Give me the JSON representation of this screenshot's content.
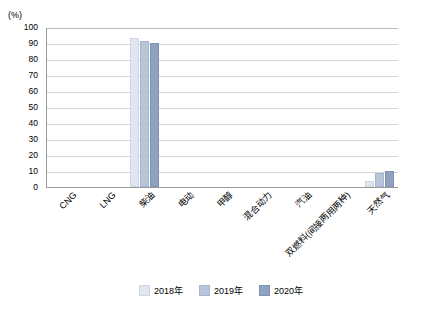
{
  "chart_data": {
    "type": "bar",
    "title": "",
    "xlabel": "",
    "ylabel": "(%)",
    "ylim": [
      0,
      100
    ],
    "yticks": [
      100,
      90,
      80,
      70,
      60,
      50,
      40,
      30,
      20,
      10,
      0
    ],
    "grid": true,
    "legend_position": "bottom",
    "categories": [
      "CNG",
      "LNG",
      "柴油",
      "电动",
      "甲醇",
      "混合动力",
      "汽油",
      "双燃料(间接两用两种)",
      "天然气"
    ],
    "series": [
      {
        "name": "2018年",
        "color": "#dfe6f0",
        "values": [
          0,
          0,
          93,
          0,
          0,
          0,
          0,
          0,
          4
        ]
      },
      {
        "name": "2019年",
        "color": "#b7c4da",
        "values": [
          0,
          0,
          91,
          0,
          0,
          0,
          0,
          0,
          9
        ]
      },
      {
        "name": "2020年",
        "color": "#8fa2c2",
        "values": [
          0,
          0,
          90,
          0,
          0,
          0,
          0,
          0,
          10
        ]
      }
    ]
  }
}
